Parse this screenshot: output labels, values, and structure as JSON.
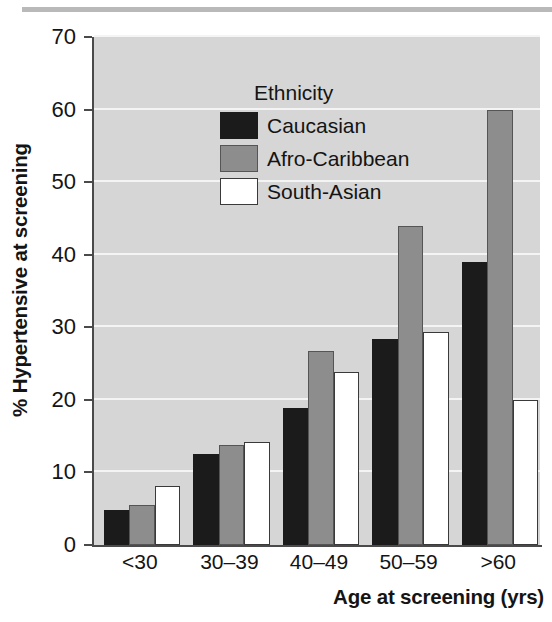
{
  "chart_data": {
    "type": "bar",
    "title": "",
    "xlabel": "Age at screening (yrs)",
    "ylabel": "% Hypertensive at screening",
    "categories": [
      "<30",
      "30–39",
      "40–49",
      "50–59",
      ">60"
    ],
    "series": [
      {
        "name": "Caucasian",
        "values": [
          4.8,
          12.6,
          18.9,
          28.4,
          39.0
        ],
        "color": "#1b1b1b"
      },
      {
        "name": "Afro-Caribbean",
        "values": [
          5.5,
          13.8,
          26.7,
          43.9,
          60.0
        ],
        "color": "#8d8d8d"
      },
      {
        "name": "South-Asian",
        "values": [
          8.2,
          14.2,
          23.9,
          29.3,
          20.0
        ],
        "color": "#ffffff"
      }
    ],
    "ylim": [
      0,
      70
    ],
    "yticks": [
      0,
      10,
      20,
      30,
      40,
      50,
      60,
      70
    ],
    "ytick_labels": [
      "0",
      "10",
      "20",
      "30",
      "40",
      "50",
      "60",
      "70"
    ],
    "grid": true,
    "legend_position": "upper-left",
    "legend_title": "Ethnicity",
    "plot_background": "#d6d6d6",
    "gridline_color": "#f4f4f4"
  },
  "legend": {
    "title": "Ethnicity",
    "entries": [
      {
        "label": "Caucasian"
      },
      {
        "label": "Afro-Caribbean"
      },
      {
        "label": "South-Asian"
      }
    ]
  },
  "axes": {
    "y_title": "% Hypertensive at screening",
    "x_title": "Age at screening (yrs)"
  }
}
